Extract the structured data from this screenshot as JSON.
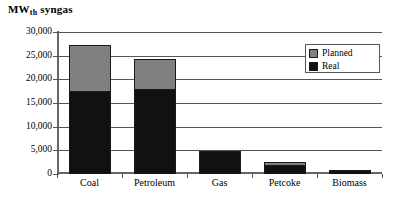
{
  "chart_data": {
    "type": "bar",
    "title": "MWth syngas",
    "title_main": "MW",
    "title_sub": "th",
    "title_tail": " syngas",
    "xlabel": "",
    "ylabel": "",
    "stacked": true,
    "grid": true,
    "legend_position": "top-right",
    "ylim": [
      0,
      30000
    ],
    "yticks": [
      0,
      5000,
      10000,
      15000,
      20000,
      25000,
      30000
    ],
    "ytick_labels": [
      "0",
      "5,000",
      "10,000",
      "15,000",
      "20,000",
      "25,000",
      "30,000"
    ],
    "categories": [
      "Coal",
      "Petroleum",
      "Gas",
      "Petcoke",
      "Biomass"
    ],
    "series": [
      {
        "name": "Real",
        "color": "#111111",
        "values": [
          17500,
          18000,
          4900,
          1800,
          800
        ]
      },
      {
        "name": "Planned",
        "color": "#808080",
        "values": [
          9700,
          6200,
          0,
          800,
          0
        ]
      }
    ],
    "totals": [
      27200,
      24200,
      4900,
      2600,
      800
    ],
    "legend": [
      "Planned",
      "Real"
    ]
  }
}
